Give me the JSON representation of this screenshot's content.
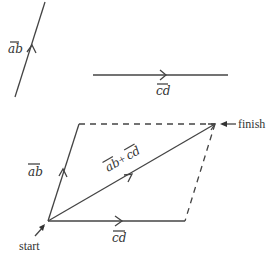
{
  "diagram": {
    "vectors": {
      "ab": {
        "label": "ab",
        "arrow_over": true
      },
      "cd": {
        "label": "cd",
        "arrow_over": true
      },
      "sum": {
        "label": "ab + cd",
        "label_a": "ab",
        "label_plus": "+",
        "label_b": "cd"
      }
    },
    "annotations": {
      "start": "start",
      "finish": "finish"
    },
    "colors": {
      "line": "#444444",
      "text": "#333333",
      "background": "#ffffff"
    }
  }
}
